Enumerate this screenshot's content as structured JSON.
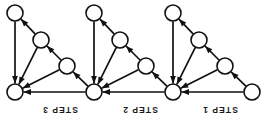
{
  "figure": {
    "width": 272,
    "height": 127,
    "background_color": "#ffffff",
    "ink_color": "#111111",
    "node_fill_color": "#ffffff",
    "node_radius": 8,
    "node_count": 10,
    "edge_count": 18
  },
  "labels": [
    {
      "id": "step-3",
      "text": "STEP 3",
      "x": 30,
      "y": 104,
      "width": 60,
      "rotated_180": true
    },
    {
      "id": "step-2",
      "text": "STEP 2",
      "x": 110,
      "y": 104,
      "width": 60,
      "rotated_180": true
    },
    {
      "id": "step-1",
      "text": "STEP 1",
      "x": 190,
      "y": 104,
      "width": 60,
      "rotated_180": true
    }
  ],
  "nodes": [
    {
      "id": "n-b3-top",
      "block": "step-3",
      "role": "top",
      "cx": 15,
      "cy": 13,
      "r": 8
    },
    {
      "id": "n-b3-mid",
      "block": "step-3",
      "role": "mid",
      "cx": 41,
      "cy": 40,
      "r": 8
    },
    {
      "id": "n-b3-low",
      "block": "step-3",
      "role": "low",
      "cx": 67,
      "cy": 66,
      "r": 8
    },
    {
      "id": "n-b3-base",
      "block": "step-3",
      "role": "base",
      "cx": 15,
      "cy": 92,
      "r": 8
    },
    {
      "id": "n-b2-top",
      "block": "step-2",
      "role": "top",
      "cx": 94,
      "cy": 13,
      "r": 8
    },
    {
      "id": "n-b2-mid",
      "block": "step-2",
      "role": "mid",
      "cx": 120,
      "cy": 40,
      "r": 8
    },
    {
      "id": "n-b2-low",
      "block": "step-2",
      "role": "low",
      "cx": 146,
      "cy": 66,
      "r": 8
    },
    {
      "id": "n-b2-base",
      "block": "step-2",
      "role": "base",
      "cx": 94,
      "cy": 92,
      "r": 8
    },
    {
      "id": "n-b1-top",
      "block": "step-1",
      "role": "top",
      "cx": 173,
      "cy": 13,
      "r": 8
    },
    {
      "id": "n-b1-mid",
      "block": "step-1",
      "role": "mid",
      "cx": 199,
      "cy": 40,
      "r": 8
    },
    {
      "id": "n-b1-low",
      "block": "step-1",
      "role": "low",
      "cx": 225,
      "cy": 66,
      "r": 8
    },
    {
      "id": "n-b1-base",
      "block": "step-1",
      "role": "base",
      "cx": 173,
      "cy": 92,
      "r": 8
    },
    {
      "id": "n-source",
      "block": "source",
      "role": "source",
      "cx": 252,
      "cy": 92,
      "r": 8
    }
  ],
  "edges": [
    {
      "id": "e-b3-mid-top",
      "from": "n-b3-mid",
      "to": "n-b3-top",
      "arrow_at": "to"
    },
    {
      "id": "e-b3-top-base",
      "from": "n-b3-top",
      "to": "n-b3-base",
      "arrow_at": "to"
    },
    {
      "id": "e-b3-mid-base",
      "from": "n-b3-mid",
      "to": "n-b3-base",
      "arrow_at": "to"
    },
    {
      "id": "e-b3-low-mid",
      "from": "n-b3-low",
      "to": "n-b3-mid",
      "arrow_at": "to"
    },
    {
      "id": "e-b3-low-base",
      "from": "n-b3-low",
      "to": "n-b3-base",
      "arrow_at": "to"
    },
    {
      "id": "e-b2-base-b3low",
      "from": "n-b2-base",
      "to": "n-b3-low",
      "arrow_at": "to"
    },
    {
      "id": "e-b2-base-b3base",
      "from": "n-b2-base",
      "to": "n-b3-base",
      "arrow_at": "to"
    },
    {
      "id": "e-b2-mid-top",
      "from": "n-b2-mid",
      "to": "n-b2-top",
      "arrow_at": "to"
    },
    {
      "id": "e-b2-top-base",
      "from": "n-b2-top",
      "to": "n-b2-base",
      "arrow_at": "to"
    },
    {
      "id": "e-b2-mid-base",
      "from": "n-b2-mid",
      "to": "n-b2-base",
      "arrow_at": "to"
    },
    {
      "id": "e-b2-low-mid",
      "from": "n-b2-low",
      "to": "n-b2-mid",
      "arrow_at": "to"
    },
    {
      "id": "e-b2-low-base",
      "from": "n-b2-low",
      "to": "n-b2-base",
      "arrow_at": "to"
    },
    {
      "id": "e-b1-base-b2low",
      "from": "n-b1-base",
      "to": "n-b2-low",
      "arrow_at": "to"
    },
    {
      "id": "e-b1-base-b2base",
      "from": "n-b1-base",
      "to": "n-b2-base",
      "arrow_at": "to"
    },
    {
      "id": "e-b1-mid-top",
      "from": "n-b1-mid",
      "to": "n-b1-top",
      "arrow_at": "to"
    },
    {
      "id": "e-b1-top-base",
      "from": "n-b1-top",
      "to": "n-b1-base",
      "arrow_at": "to"
    },
    {
      "id": "e-b1-mid-base",
      "from": "n-b1-mid",
      "to": "n-b1-base",
      "arrow_at": "to"
    },
    {
      "id": "e-b1-low-mid",
      "from": "n-b1-low",
      "to": "n-b1-mid",
      "arrow_at": "to"
    },
    {
      "id": "e-b1-low-base",
      "from": "n-b1-low",
      "to": "n-b1-base",
      "arrow_at": "to"
    },
    {
      "id": "e-source-b1low",
      "from": "n-source",
      "to": "n-b1-low",
      "arrow_at": "to"
    },
    {
      "id": "e-source-b1base",
      "from": "n-source",
      "to": "n-b1-base",
      "arrow_at": "to"
    }
  ]
}
